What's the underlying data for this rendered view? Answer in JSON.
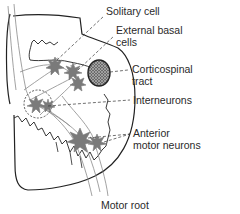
{
  "diagram": {
    "labels": [
      {
        "id": "solitary-cell",
        "line1": "Solitary cell",
        "line2": ""
      },
      {
        "id": "external-basal-cells",
        "line1": "External basal",
        "line2": "cells"
      },
      {
        "id": "corticospinal-tract",
        "line1": "Corticospinal",
        "line2": "tract"
      },
      {
        "id": "interneurons",
        "line1": "Interneurons",
        "line2": ""
      },
      {
        "id": "anterior-motor-neurons",
        "line1": "Anterior",
        "line2": "motor neurons"
      },
      {
        "id": "motor-root",
        "line1": "Motor root",
        "line2": ""
      }
    ],
    "colors": {
      "outline": "#222222",
      "fiber": "#8a8a8a",
      "neuron": "#7a7a7a",
      "tract_fill": "#555555",
      "text": "#2a2a2a"
    }
  }
}
